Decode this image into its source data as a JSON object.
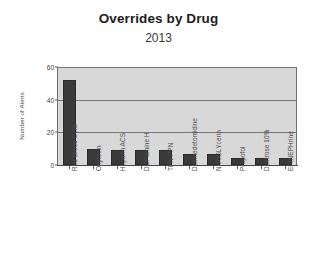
{
  "chart_data": {
    "type": "bar",
    "title": "Overrides by Drug",
    "subtitle": "2013",
    "xlabel": "",
    "ylabel": "Number of Alerts",
    "ylim": [
      0,
      60
    ],
    "yticks": [
      0,
      20,
      40,
      60
    ],
    "grid": true,
    "legend": null,
    "categories": [
      "Red Blood Cells",
      "Oxytocin",
      "Heparin ACS",
      "DOPamine H",
      "TPN PPN",
      "Dexmedetomidine",
      "NitroGLYcerin",
      "Propofol",
      "Dextrose 10%",
      "EPINEPHrine"
    ],
    "values": [
      52,
      10,
      9,
      9,
      9,
      7,
      7,
      4,
      4,
      4
    ],
    "colors": {
      "bar": "#3a3a3a",
      "plot_background": "#d8d8d8",
      "gridline": "#757575",
      "axis": "#4a4a4a",
      "page_background": "#ffffff",
      "title_text": "#1d1d1d"
    }
  }
}
